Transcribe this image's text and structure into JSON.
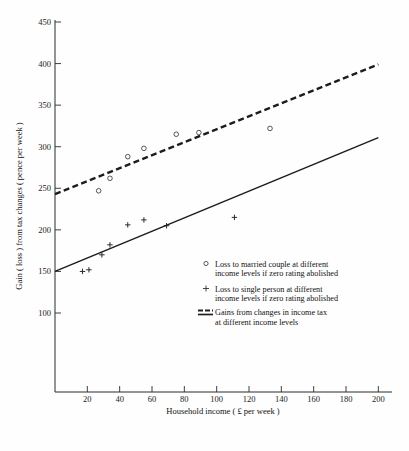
{
  "chart_data": {
    "type": "scatter",
    "title": "",
    "xlabel": "Household income ( £ per week )",
    "ylabel": "Gain ( loss ) from tax changes ( pence per week )",
    "xlim": [
      0,
      206
    ],
    "ylim": [
      60,
      455
    ],
    "grid": false,
    "x_ticks": [
      20,
      40,
      60,
      80,
      100,
      120,
      140,
      160,
      180,
      200
    ],
    "y_ticks": [
      100,
      150,
      200,
      250,
      300,
      350,
      400,
      450
    ],
    "legend_position": "inside-lower-right",
    "series": [
      {
        "name": "Loss to married couple at different income levels if zero rating abolished",
        "type": "scatter",
        "marker": "open-circle",
        "points": [
          {
            "x": 27,
            "y": 247
          },
          {
            "x": 34,
            "y": 262
          },
          {
            "x": 45,
            "y": 288
          },
          {
            "x": 55,
            "y": 298
          },
          {
            "x": 75,
            "y": 315
          },
          {
            "x": 89,
            "y": 317
          },
          {
            "x": 133,
            "y": 322
          }
        ]
      },
      {
        "name": "Loss to single person at different income levels if zero rating abolished",
        "type": "scatter",
        "marker": "plus",
        "points": [
          {
            "x": 17,
            "y": 150
          },
          {
            "x": 21,
            "y": 152
          },
          {
            "x": 29,
            "y": 170
          },
          {
            "x": 34,
            "y": 182
          },
          {
            "x": 45,
            "y": 206
          },
          {
            "x": 55,
            "y": 212
          },
          {
            "x": 69,
            "y": 205
          },
          {
            "x": 111,
            "y": 215
          }
        ]
      },
      {
        "name": "Gains from changes in income tax at different income levels (upper, dashed)",
        "type": "line",
        "style": "dashed",
        "points": [
          {
            "x": 0,
            "y": 243
          },
          {
            "x": 200,
            "y": 399
          }
        ]
      },
      {
        "name": "Gains from changes in income tax at different income levels (lower, solid)",
        "type": "line",
        "style": "solid",
        "points": [
          {
            "x": 0,
            "y": 150
          },
          {
            "x": 200,
            "y": 311
          }
        ]
      }
    ],
    "legend_entries": [
      {
        "marker": "open-circle",
        "line1": "Loss to married couple at different",
        "line2": "income levels if zero rating abolished"
      },
      {
        "marker": "plus",
        "line1": "Loss to single person at different",
        "line2": "income levels if zero rating  abolished"
      },
      {
        "marker": "double-line",
        "line1": "Gains from changes in income tax",
        "line2": "at different income levels"
      }
    ]
  }
}
